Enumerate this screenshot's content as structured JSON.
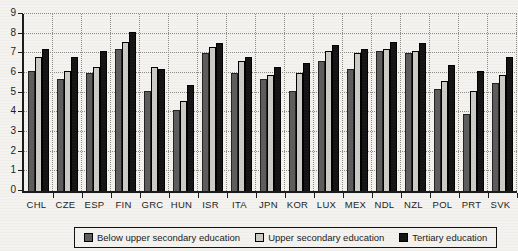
{
  "chart_data": {
    "type": "bar",
    "title": "",
    "xlabel": "",
    "ylabel": "",
    "ylim": [
      0,
      9
    ],
    "yticks": [
      0,
      1,
      2,
      3,
      4,
      5,
      6,
      7,
      8,
      9
    ],
    "grid": "dotted",
    "legend_position": "bottom",
    "categories": [
      "CHL",
      "CZE",
      "ESP",
      "FIN",
      "GRC",
      "HUN",
      "ISR",
      "ITA",
      "JPN",
      "KOR",
      "LUX",
      "MEX",
      "NDL",
      "NZL",
      "POL",
      "PRT",
      "SVK"
    ],
    "series": [
      {
        "name": "Below upper secondary education",
        "color": "#5d5d5d",
        "edge": "#222222",
        "values": [
          6.1,
          5.7,
          6.0,
          7.2,
          5.1,
          4.1,
          7.0,
          6.0,
          5.7,
          5.1,
          6.6,
          6.2,
          7.1,
          7.0,
          5.2,
          3.9,
          5.5
        ]
      },
      {
        "name": "Upper secondary education",
        "color": "#cccbc6",
        "edge": "#000000",
        "values": [
          6.8,
          6.1,
          6.3,
          7.6,
          6.3,
          4.6,
          7.3,
          6.6,
          5.9,
          6.0,
          7.1,
          7.0,
          7.2,
          7.1,
          5.6,
          5.1,
          5.9
        ]
      },
      {
        "name": "Tertiary education",
        "color": "#141414",
        "edge": "#000000",
        "values": [
          7.2,
          6.8,
          7.1,
          8.1,
          6.2,
          5.4,
          7.5,
          6.8,
          6.3,
          6.5,
          7.4,
          7.2,
          7.6,
          7.5,
          6.4,
          6.1,
          6.8
        ]
      }
    ]
  }
}
